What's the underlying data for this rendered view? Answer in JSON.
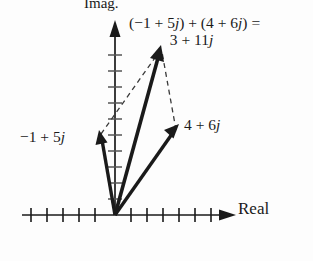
{
  "figure": {
    "background": "#fdfdfd",
    "ink": "#1a1a1a",
    "axes": {
      "imag_label": "Imag.",
      "real_label": "Real",
      "origin": {
        "x": 115,
        "y": 215
      },
      "tick_spacing": 16,
      "real_axis": {
        "x_start": 22,
        "x_end": 222,
        "y": 215,
        "ticks_left": 6,
        "ticks_right": 6
      },
      "imag_axis": {
        "y_start": 25,
        "y_end": 215,
        "x": 115,
        "ticks": 11
      }
    },
    "vectors": [
      {
        "name": "vector-minus1-plus-5j",
        "label": "−1 + 5j",
        "label_plain": "-1 + 5j",
        "components": {
          "real": -1,
          "imag": 5
        },
        "tip": {
          "x": 100,
          "y": 133
        },
        "style": "solid"
      },
      {
        "name": "vector-4-plus-6j",
        "label": "4 + 6j",
        "label_plain": "4 + 6j",
        "components": {
          "real": 4,
          "imag": 6
        },
        "tip": {
          "x": 175,
          "y": 128
        },
        "style": "solid"
      },
      {
        "name": "vector-resultant-3-plus-11j",
        "label": "3 + 11j",
        "label_plain": "3 + 11j",
        "components": {
          "real": 3,
          "imag": 11
        },
        "tip": {
          "x": 160,
          "y": 48
        },
        "style": "solid"
      }
    ],
    "dashed_lines": [
      {
        "name": "dashed-from-v1-to-sum",
        "from": {
          "x": 100,
          "y": 133
        },
        "to": {
          "x": 160,
          "y": 48
        }
      },
      {
        "name": "dashed-from-v2-to-sum",
        "from": {
          "x": 175,
          "y": 128
        },
        "to": {
          "x": 160,
          "y": 48
        }
      }
    ],
    "equation": {
      "line1": "(−1 + 5j) + (4 + 6j) =",
      "line2": "3 + 11j"
    }
  },
  "chart_data": {
    "type": "scatter",
    "title": "",
    "xlabel": "Real",
    "ylabel": "Imag.",
    "annotations": [
      "(−1 + 5j) + (4 + 6j) =",
      "3 + 11j",
      "−1 + 5j",
      "4 + 6j"
    ],
    "series": [
      {
        "name": "−1 + 5j",
        "x": [
          0,
          -1
        ],
        "y": [
          0,
          5
        ]
      },
      {
        "name": "4 + 6j",
        "x": [
          0,
          4
        ],
        "y": [
          0,
          6
        ]
      },
      {
        "name": "3 + 11j",
        "x": [
          0,
          3
        ],
        "y": [
          0,
          11
        ]
      }
    ],
    "xlim": [
      -6,
      7
    ],
    "ylim": [
      0,
      12
    ],
    "grid": false,
    "legend": "none"
  }
}
